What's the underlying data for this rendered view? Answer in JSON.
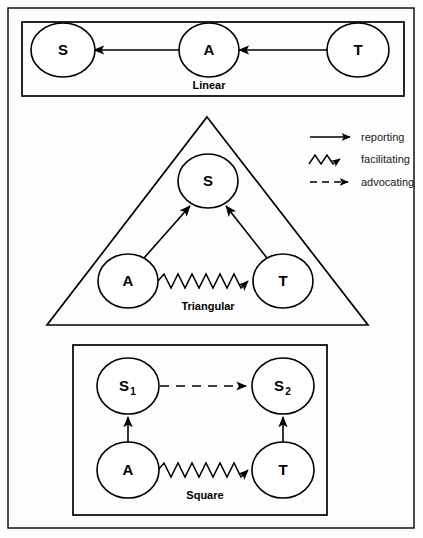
{
  "figure": {
    "background_color": "#fdfdfd",
    "line_color": "#000000"
  },
  "legend": {
    "name": "legend",
    "items": [
      {
        "id": "reporting",
        "label": "reporting",
        "line_style": "solid",
        "arrow": "filled"
      },
      {
        "id": "facilitating",
        "label": "facilitating",
        "line_style": "zigzag",
        "arrow": "filled"
      },
      {
        "id": "advocating",
        "label": "advocating",
        "line_style": "dashed",
        "arrow": "filled"
      }
    ]
  },
  "panels": [
    {
      "id": "linear",
      "caption": "Linear",
      "shape": "rectangle",
      "nodes": [
        {
          "id": "linear-s",
          "label": "S",
          "sub": ""
        },
        {
          "id": "linear-a",
          "label": "A",
          "sub": ""
        },
        {
          "id": "linear-t",
          "label": "T",
          "sub": ""
        }
      ],
      "edges": [
        {
          "from": "A",
          "to": "S",
          "type": "reporting"
        },
        {
          "from": "T",
          "to": "A",
          "type": "reporting"
        }
      ]
    },
    {
      "id": "triangular",
      "caption": "Triangular",
      "shape": "triangle",
      "nodes": [
        {
          "id": "tri-s",
          "label": "S",
          "sub": ""
        },
        {
          "id": "tri-a",
          "label": "A",
          "sub": ""
        },
        {
          "id": "tri-t",
          "label": "T",
          "sub": ""
        }
      ],
      "edges": [
        {
          "from": "A",
          "to": "S",
          "type": "reporting"
        },
        {
          "from": "T",
          "to": "S",
          "type": "reporting"
        },
        {
          "from": "A",
          "to": "T",
          "type": "facilitating"
        }
      ]
    },
    {
      "id": "square",
      "caption": "Square",
      "shape": "rectangle",
      "nodes": [
        {
          "id": "sq-s1",
          "label": "S",
          "sub": "1"
        },
        {
          "id": "sq-s2",
          "label": "S",
          "sub": "2"
        },
        {
          "id": "sq-a",
          "label": "A",
          "sub": ""
        },
        {
          "id": "sq-t",
          "label": "T",
          "sub": ""
        }
      ],
      "edges": [
        {
          "from": "S1",
          "to": "S2",
          "type": "advocating"
        },
        {
          "from": "A",
          "to": "S1",
          "type": "reporting"
        },
        {
          "from": "T",
          "to": "S2",
          "type": "reporting"
        },
        {
          "from": "A",
          "to": "T",
          "type": "facilitating"
        }
      ]
    }
  ]
}
